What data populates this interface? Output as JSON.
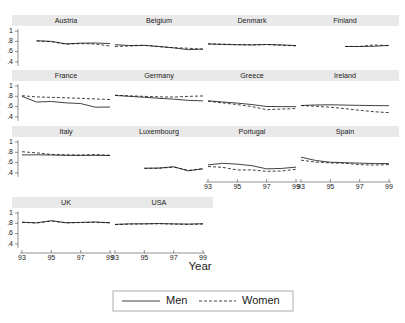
{
  "chart_data": {
    "type": "line",
    "title": "",
    "xlabel": "Year",
    "ylabel": "",
    "layout": "small-multiples trellis, 4 columns x 4 rows",
    "grid": false,
    "xlim": [
      93,
      99
    ],
    "ylim": [
      0.3,
      1.08
    ],
    "x": [
      93,
      94,
      95,
      96,
      97,
      98,
      99
    ],
    "xticks": [
      93,
      95,
      97,
      99
    ],
    "xticklabels": [
      "93",
      "95",
      "97",
      "99"
    ],
    "yticks": [
      1,
      0.8,
      0.6,
      0.4
    ],
    "yticklabels": [
      "1",
      ".8",
      ".6",
      ".4"
    ],
    "legend": {
      "position": "bottom-center-boxed",
      "entries": [
        {
          "name": "Men",
          "style": "solid"
        },
        {
          "name": "Women",
          "style": "dashed"
        }
      ]
    },
    "panels": [
      {
        "name": "Austria",
        "row": 0,
        "col": 0,
        "series": [
          {
            "name": "Men",
            "x": [
              93,
              94,
              95,
              96,
              97,
              98,
              99
            ],
            "values": [
              null,
              0.812,
              0.8,
              0.752,
              0.765,
              0.768,
              0.757
            ]
          },
          {
            "name": "Women",
            "x": [
              93,
              94,
              95,
              96,
              97,
              98,
              99
            ],
            "values": [
              null,
              0.808,
              0.793,
              0.745,
              0.757,
              0.748,
              0.71
            ]
          }
        ]
      },
      {
        "name": "Belgium",
        "row": 0,
        "col": 1,
        "series": [
          {
            "name": "Men",
            "x": [
              93,
              94,
              95,
              96,
              97,
              98,
              99
            ],
            "values": [
              0.735,
              0.718,
              0.722,
              0.7,
              0.673,
              0.638,
              0.651
            ]
          },
          {
            "name": "Women",
            "x": [
              93,
              94,
              95,
              96,
              97,
              98,
              99
            ],
            "values": [
              0.7,
              0.71,
              0.724,
              0.697,
              0.676,
              0.666,
              0.646
            ]
          }
        ]
      },
      {
        "name": "Denmark",
        "row": 0,
        "col": 2,
        "series": [
          {
            "name": "Men",
            "x": [
              93,
              94,
              95,
              96,
              97,
              98,
              99
            ],
            "values": [
              0.748,
              0.74,
              0.734,
              0.73,
              0.74,
              0.731,
              0.718
            ]
          },
          {
            "name": "Women",
            "x": [
              93,
              94,
              95,
              96,
              97,
              98,
              99
            ],
            "values": [
              0.752,
              0.747,
              0.736,
              0.733,
              0.737,
              0.724,
              0.712
            ]
          }
        ]
      },
      {
        "name": "Finland",
        "row": 0,
        "col": 3,
        "series": [
          {
            "name": "Men",
            "x": [
              96,
              97,
              98,
              99
            ],
            "values": [
              0.7,
              0.7,
              0.704,
              0.722
            ]
          },
          {
            "name": "Women",
            "x": [
              96,
              97,
              98,
              99
            ],
            "values": [
              0.701,
              0.7,
              0.73,
              0.717
            ]
          }
        ]
      },
      {
        "name": "France",
        "row": 1,
        "col": 0,
        "series": [
          {
            "name": "Men",
            "x": [
              93,
              94,
              95,
              96,
              97,
              98,
              99
            ],
            "values": [
              0.8,
              0.69,
              0.7,
              0.673,
              0.66,
              0.588,
              0.592
            ]
          },
          {
            "name": "Women",
            "x": [
              93,
              94,
              95,
              96,
              97,
              98,
              99
            ],
            "values": [
              0.812,
              0.79,
              0.78,
              0.772,
              0.762,
              0.75,
              0.738
            ]
          }
        ]
      },
      {
        "name": "Germany",
        "row": 1,
        "col": 1,
        "series": [
          {
            "name": "Men",
            "x": [
              93,
              94,
              95,
              96,
              97,
              98,
              99
            ],
            "values": [
              0.818,
              0.8,
              0.782,
              0.762,
              0.746,
              0.722,
              0.712
            ]
          },
          {
            "name": "Women",
            "x": [
              93,
              94,
              95,
              96,
              97,
              98,
              99
            ],
            "values": [
              0.822,
              0.81,
              0.8,
              0.79,
              0.786,
              0.8,
              0.808
            ]
          }
        ]
      },
      {
        "name": "Greece",
        "row": 1,
        "col": 2,
        "series": [
          {
            "name": "Men",
            "x": [
              93,
              94,
              95,
              96,
              97,
              98,
              99
            ],
            "values": [
              0.712,
              0.69,
              0.668,
              0.64,
              0.602,
              0.6,
              0.6
            ]
          },
          {
            "name": "Women",
            "x": [
              93,
              94,
              95,
              96,
              97,
              98,
              99
            ],
            "values": [
              0.706,
              0.672,
              0.64,
              0.6,
              0.54,
              0.552,
              0.562
            ]
          }
        ]
      },
      {
        "name": "Ireland",
        "row": 1,
        "col": 3,
        "series": [
          {
            "name": "Men",
            "x": [
              93,
              94,
              95,
              96,
              97,
              98,
              99
            ],
            "values": [
              0.622,
              0.632,
              0.636,
              0.63,
              0.624,
              0.62,
              0.618
            ]
          },
          {
            "name": "Women",
            "x": [
              93,
              94,
              95,
              96,
              97,
              98,
              99
            ],
            "values": [
              0.62,
              0.608,
              0.588,
              0.56,
              0.528,
              0.5,
              0.482
            ]
          }
        ]
      },
      {
        "name": "Italy",
        "row": 2,
        "col": 0,
        "series": [
          {
            "name": "Men",
            "x": [
              93,
              94,
              95,
              96,
              97,
              98,
              99
            ],
            "values": [
              0.75,
              0.752,
              0.748,
              0.742,
              0.74,
              0.742,
              0.738
            ]
          },
          {
            "name": "Women",
            "x": [
              93,
              94,
              95,
              96,
              97,
              98,
              99
            ],
            "values": [
              0.812,
              0.79,
              0.76,
              0.752,
              0.748,
              0.758,
              0.742
            ]
          }
        ]
      },
      {
        "name": "Luxembourg",
        "row": 2,
        "col": 1,
        "series": [
          {
            "name": "Men",
            "x": [
              95,
              96,
              97,
              98,
              99
            ],
            "values": [
              0.49,
              0.494,
              0.52,
              0.44,
              0.478
            ]
          },
          {
            "name": "Women",
            "x": [
              95,
              96,
              97,
              98,
              99
            ],
            "values": [
              0.489,
              0.49,
              0.512,
              0.447,
              0.484
            ]
          }
        ]
      },
      {
        "name": "Portugal",
        "row": 2,
        "col": 2,
        "series": [
          {
            "name": "Men",
            "x": [
              93,
              94,
              95,
              96,
              97,
              98,
              99
            ],
            "values": [
              0.556,
              0.586,
              0.57,
              0.54,
              0.478,
              0.486,
              0.512
            ]
          },
          {
            "name": "Women",
            "x": [
              93,
              94,
              95,
              96,
              97,
              98,
              99
            ],
            "values": [
              0.524,
              0.508,
              0.456,
              0.458,
              0.43,
              0.436,
              0.47
            ]
          }
        ]
      },
      {
        "name": "Spain",
        "row": 2,
        "col": 3,
        "series": [
          {
            "name": "Men",
            "x": [
              93,
              94,
              95,
              96,
              97,
              98,
              99
            ],
            "values": [
              0.706,
              0.642,
              0.608,
              0.598,
              0.59,
              0.582,
              0.58
            ]
          },
          {
            "name": "Women",
            "x": [
              93,
              94,
              95,
              96,
              97,
              98,
              99
            ],
            "values": [
              0.648,
              0.61,
              0.594,
              0.588,
              0.56,
              0.552,
              0.562
            ]
          }
        ]
      },
      {
        "name": "UK",
        "row": 3,
        "col": 0,
        "series": [
          {
            "name": "Men",
            "x": [
              93,
              94,
              95,
              96,
              97,
              98,
              99
            ],
            "values": [
              0.822,
              0.81,
              0.852,
              0.812,
              0.818,
              0.826,
              0.812
            ]
          },
          {
            "name": "Women",
            "x": [
              93,
              94,
              95,
              96,
              97,
              98,
              99
            ],
            "values": [
              0.82,
              0.808,
              0.846,
              0.81,
              0.816,
              0.822,
              0.81
            ]
          }
        ]
      },
      {
        "name": "USA",
        "row": 3,
        "col": 1,
        "series": [
          {
            "name": "Men",
            "x": [
              93,
              94,
              95,
              96,
              97,
              98,
              99
            ],
            "values": [
              0.78,
              0.79,
              0.792,
              0.796,
              0.79,
              0.786,
              0.792
            ]
          },
          {
            "name": "Women",
            "x": [
              93,
              94,
              95,
              96,
              97,
              98,
              99
            ],
            "values": [
              0.776,
              0.786,
              0.788,
              0.794,
              0.786,
              0.78,
              0.788
            ]
          }
        ]
      }
    ]
  },
  "axis": {
    "x_title": "Year",
    "yticklabels": [
      "1",
      ".8",
      ".6",
      ".4"
    ],
    "xticklabels": [
      "93",
      "95",
      "97",
      "99"
    ]
  },
  "legend": {
    "men_label": "Men",
    "women_label": "Women"
  },
  "colors": {
    "line": "#111111",
    "strip_background": "#e9e9e9",
    "axis": "#4a4a4a",
    "legend_border": "#8a8a8a",
    "page_background": "#ffffff"
  }
}
